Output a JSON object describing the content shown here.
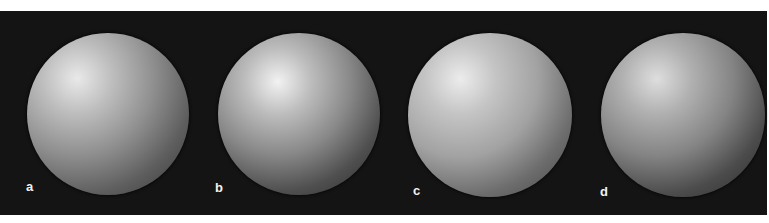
{
  "figure": {
    "background": "#141414",
    "panels": [
      {
        "label": "a",
        "cx": 108,
        "cy": 114,
        "r": 81,
        "hx": 31,
        "hy": 28,
        "stops": [
          "#e9e9e9",
          "#bdbdbd",
          "#8e8e8e",
          "#5e5e5e",
          "#4a4a4a",
          "#6a6a6a"
        ]
      },
      {
        "label": "b",
        "cx": 299,
        "cy": 114,
        "r": 81,
        "hx": 37,
        "hy": 30,
        "stops": [
          "#f2f2f2",
          "#bcbcbc",
          "#888888",
          "#4f4f4f",
          "#3c3c3c",
          "#676767"
        ]
      },
      {
        "label": "c",
        "cx": 490,
        "cy": 115,
        "r": 82,
        "hx": 32,
        "hy": 28,
        "stops": [
          "#ececec",
          "#c4c4c4",
          "#a2a2a2",
          "#6d6d6d",
          "#585858",
          "#7a7a7a"
        ]
      },
      {
        "label": "d",
        "cx": 683,
        "cy": 115,
        "r": 82,
        "hx": 34,
        "hy": 28,
        "stops": [
          "#dedede",
          "#b0b0b0",
          "#848484",
          "#4c4c4c",
          "#3a3a3a",
          "#5e5e5e"
        ]
      }
    ],
    "labels": [
      {
        "text": "a",
        "x": 26,
        "y": 180
      },
      {
        "text": "b",
        "x": 215,
        "y": 181
      },
      {
        "text": "c",
        "x": 413,
        "y": 184
      },
      {
        "text": "d",
        "x": 600,
        "y": 185
      }
    ]
  }
}
